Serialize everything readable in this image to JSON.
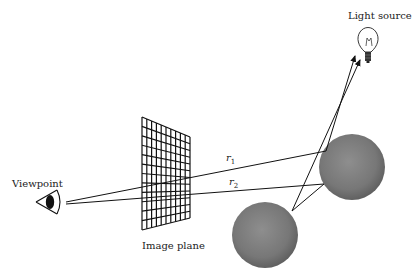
{
  "diagram": {
    "labels": {
      "viewpoint": "Viewpoint",
      "image_plane": "Image plane",
      "light_source": "Light source"
    },
    "rays": [
      {
        "name": "r",
        "sub": "1"
      },
      {
        "name": "r",
        "sub": "2"
      }
    ],
    "colors": {
      "sphere": "#7a7a7a",
      "sphere_highlight": "#9a9a9a",
      "line": "#111111",
      "background": "#ffffff"
    },
    "grid": {
      "columns": 10,
      "rows": 12
    }
  }
}
